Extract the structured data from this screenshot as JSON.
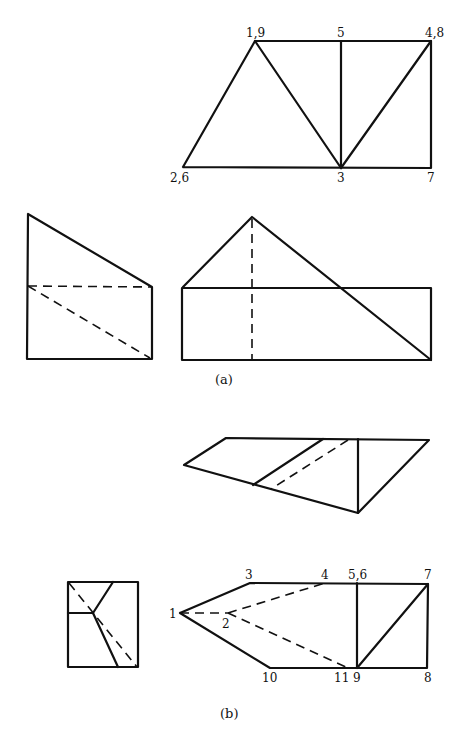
{
  "figure_a": {
    "caption": "(a)",
    "top_view_labels": {
      "v1_9": "1,9",
      "v5": "5",
      "v4_8": "4,8",
      "v2_6": "2,6",
      "v3": "3",
      "v7": "7"
    }
  },
  "figure_b": {
    "caption": "(b)",
    "front_view_labels": {
      "v1": "1",
      "v2": "2",
      "v3": "3",
      "v4": "4",
      "v5_6": "5,6",
      "v7": "7",
      "v8": "8",
      "v9": "9",
      "v10": "10",
      "v11": "11"
    }
  },
  "colors": {
    "line": "#111111",
    "background": "#ffffff"
  }
}
